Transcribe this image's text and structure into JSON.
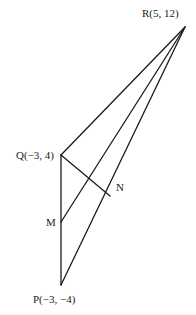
{
  "diagram": {
    "points": {
      "R": {
        "label": "R(5, 12)",
        "x": 185,
        "y": 27
      },
      "Q": {
        "label": "Q(−3, 4)",
        "x": 61,
        "y": 155
      },
      "P": {
        "label": "P(−3, −4)",
        "x": 61,
        "y": 285
      },
      "M": {
        "label": "M",
        "x": 61,
        "y": 222
      },
      "N": {
        "label": "N",
        "x": 110,
        "y": 196
      }
    },
    "segments": [
      {
        "from": "Q",
        "to": "R"
      },
      {
        "from": "P",
        "to": "R"
      },
      {
        "from": "Q",
        "to": "P"
      },
      {
        "from": "M",
        "to": "R"
      },
      {
        "from": "Q",
        "to": "N"
      }
    ],
    "stroke_color": "#1a1a1a"
  }
}
